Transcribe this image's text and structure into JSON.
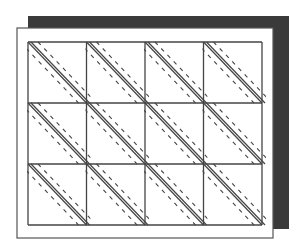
{
  "diagram": {
    "title": "",
    "grid": {
      "columns": 4,
      "rows": 3
    },
    "colors": {
      "background": "#ffffff",
      "shadow": "#3a3a3a",
      "panel": "#ffffff",
      "stroke": "#444444"
    },
    "cell_pattern": {
      "solid_lines": 2,
      "dashed_lines": 2,
      "direction": "top-left to bottom-right"
    }
  }
}
